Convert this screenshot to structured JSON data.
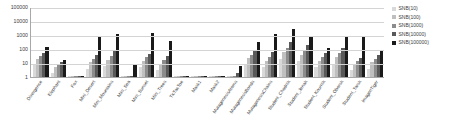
{
  "chart_data": {
    "type": "bar",
    "title": "",
    "xlabel": "",
    "ylabel": "",
    "yscale": "log",
    "ylim": [
      1,
      100000
    ],
    "yticks": [
      "1",
      "10",
      "100",
      "1000",
      "10000",
      "100000"
    ],
    "grid": true,
    "legend_position": "right",
    "categories": [
      "Divergence",
      "Elephant",
      "Fox",
      "Mini_Desert",
      "Mini_Mountains",
      "Mini_Sea",
      "Mini_Sunset",
      "Mini_Trees",
      "TicTacToe",
      "Mask1",
      "Mask2",
      "MutagenesisAtoms",
      "MutagenesisBonds",
      "MutagenesisChains",
      "Student_Chodnik",
      "Student_Jenak",
      "Student_Kournik",
      "Student_Oborsk",
      "Student_Tarsk",
      "ImagenTiger"
    ],
    "series": [
      {
        "name": "SNB(10)",
        "color": "#d9d9d9",
        "values": [
          7,
          2,
          1,
          4,
          6,
          1,
          5,
          3,
          1,
          1,
          1,
          1,
          8,
          5,
          20,
          13,
          5,
          9,
          3,
          4
        ]
      },
      {
        "name": "SNB(100)",
        "color": "#bfbfbf",
        "values": [
          20,
          5,
          1,
          12,
          16,
          1,
          14,
          9,
          1,
          1,
          1,
          1,
          22,
          15,
          60,
          40,
          14,
          26,
          8,
          11
        ]
      },
      {
        "name": "SNB(1000)",
        "color": "#8c8c8c",
        "values": [
          30,
          8,
          1,
          20,
          30,
          1,
          25,
          16,
          1,
          1,
          1,
          1,
          40,
          26,
          120,
          90,
          26,
          50,
          14,
          20
        ]
      },
      {
        "name": "SNB(10000)",
        "color": "#595959",
        "values": [
          55,
          12,
          1,
          35,
          70,
          1,
          45,
          30,
          1,
          1,
          1,
          2,
          90,
          60,
          300,
          200,
          55,
          110,
          24,
          40
        ]
      },
      {
        "name": "SNB(100000)",
        "color": "#1a1a1a",
        "values": [
          150,
          17,
          1,
          700,
          1200,
          8,
          1300,
          350,
          1,
          1,
          1,
          6,
          300,
          1100,
          2600,
          900,
          120,
          800,
          750,
          90
        ]
      }
    ]
  },
  "legend": {
    "items": [
      {
        "label": "SNB(10)"
      },
      {
        "label": "SNB(100)"
      },
      {
        "label": "SNB(1000)"
      },
      {
        "label": "SNB(10000)"
      },
      {
        "label": "SNB(100000)"
      }
    ]
  }
}
